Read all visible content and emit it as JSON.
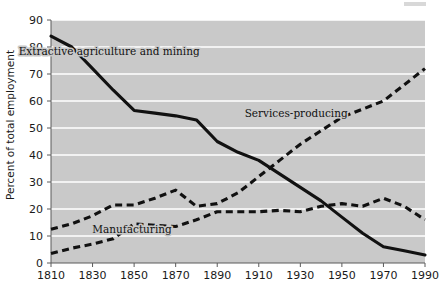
{
  "chart_data": {
    "type": "line",
    "title": "",
    "xlabel": "",
    "ylabel": "Percent of total employment",
    "xlim": [
      1810,
      1990
    ],
    "ylim": [
      0,
      90
    ],
    "grid": true,
    "legend": "inline-annotations",
    "xticks": [
      1810,
      1830,
      1850,
      1870,
      1890,
      1910,
      1930,
      1950,
      1970,
      1990
    ],
    "yticks": [
      0,
      10,
      20,
      30,
      40,
      50,
      60,
      70,
      80,
      90
    ],
    "x": [
      1810,
      1820,
      1830,
      1840,
      1850,
      1860,
      1870,
      1880,
      1890,
      1900,
      1910,
      1920,
      1930,
      1940,
      1950,
      1960,
      1970,
      1980,
      1990
    ],
    "series": [
      {
        "name": "Extractive agriculture and mining",
        "style": "solid",
        "label_x": 1838,
        "label_y": 77,
        "values": [
          84,
          80,
          72,
          64,
          56.5,
          55.5,
          54.5,
          53,
          45,
          41,
          38,
          33,
          28,
          23,
          17,
          11,
          6,
          4.5,
          3
        ]
      },
      {
        "name": "Services-producing",
        "style": "dashed",
        "label_x": 1928,
        "label_y": 54,
        "values": [
          12.5,
          14.5,
          17.5,
          21.5,
          21.5,
          24,
          27,
          21,
          22,
          26,
          32,
          38,
          44,
          49,
          54,
          57,
          60,
          66,
          72
        ]
      },
      {
        "name": "Manufacturing",
        "style": "dashed",
        "label_x": 1849,
        "label_y": 11,
        "values": [
          3.5,
          5.5,
          7,
          9,
          14.5,
          14,
          13.5,
          16,
          19,
          19,
          19,
          19.5,
          19,
          21,
          22,
          21,
          24,
          21,
          16
        ]
      }
    ]
  },
  "yaxis": {
    "title": "Percent of total employment"
  }
}
